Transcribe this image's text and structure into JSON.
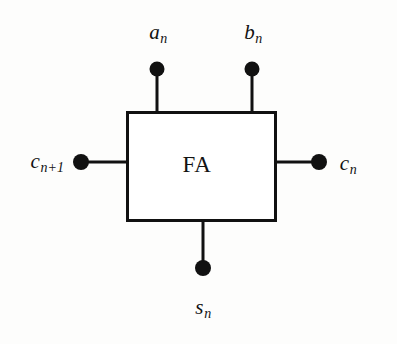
{
  "diagram": {
    "canvas": {
      "width": 397,
      "height": 344,
      "background": "#fdfdfc"
    },
    "stroke_color": "#111111",
    "block": {
      "label": "FA",
      "x": 126,
      "y": 111,
      "width": 151,
      "height": 111,
      "border_width": 3
    },
    "terminals": [
      {
        "id": "a",
        "label_base": "a",
        "label_sub": "n",
        "side": "top",
        "dot": {
          "cx": 157,
          "cy": 69,
          "r": 7
        },
        "line": {
          "x1": 157,
          "y1": 69,
          "x2": 157,
          "y2": 112
        }
      },
      {
        "id": "b",
        "label_base": "b",
        "label_sub": "n",
        "side": "top",
        "dot": {
          "cx": 252,
          "cy": 69,
          "r": 7
        },
        "line": {
          "x1": 252,
          "y1": 69,
          "x2": 252,
          "y2": 112
        }
      },
      {
        "id": "c_in",
        "label_base": "c",
        "label_sub": "n+1",
        "side": "left",
        "dot": {
          "cx": 82,
          "cy": 162,
          "r": 7.5
        },
        "line": {
          "x1": 82,
          "y1": 162,
          "x2": 126,
          "y2": 162
        }
      },
      {
        "id": "c_out",
        "label_base": "c",
        "label_sub": "n",
        "side": "right",
        "dot": {
          "cx": 318,
          "cy": 162,
          "r": 7.5
        },
        "line": {
          "x1": 277,
          "y1": 162,
          "x2": 318,
          "y2": 162
        }
      },
      {
        "id": "s",
        "label_base": "s",
        "label_sub": "n",
        "side": "bottom",
        "dot": {
          "cx": 203,
          "cy": 268,
          "r": 7.5
        },
        "line": {
          "x1": 203,
          "y1": 221,
          "x2": 203,
          "y2": 268
        }
      }
    ]
  }
}
